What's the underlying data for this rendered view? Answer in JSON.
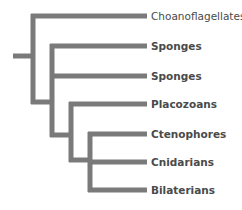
{
  "diagram": {
    "type": "phylogenetic-tree",
    "branch_color": "#7a7a7a",
    "label_color": "#4a4a4a",
    "taxa": [
      {
        "label": "Choanoflagellates",
        "bold": false
      },
      {
        "label": "Sponges",
        "bold": true
      },
      {
        "label": "Sponges",
        "bold": true
      },
      {
        "label": "Placozoans",
        "bold": true
      },
      {
        "label": "Ctenophores",
        "bold": true
      },
      {
        "label": "Cnidarians",
        "bold": true
      },
      {
        "label": "Bilaterians",
        "bold": true
      }
    ],
    "topology": "(Choanoflagellates,(Sponges,(Sponges,(Placozoans,(Ctenophores,Cnidarians,Bilaterians)))))"
  }
}
